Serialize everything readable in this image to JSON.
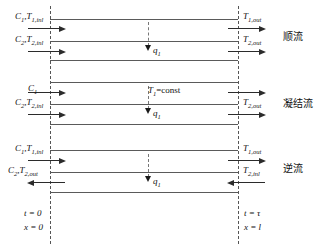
{
  "figure": {
    "type": "heat-exchanger-flow-diagram",
    "sections": [
      {
        "id": "parallel-flow",
        "mode_label": "顺流",
        "inlet_top": "C₁,T₁,inl",
        "inlet_bottom": "C₂,T₂,inl",
        "outlet_top": "T₁,out",
        "outlet_bottom": "T₂,out",
        "heat_flux": "q₁",
        "top_flow_direction": "right",
        "bottom_flow_direction": "right"
      },
      {
        "id": "condensing-flow",
        "mode_label": "凝结流",
        "inlet_top": "C₁",
        "inlet_bottom": "C₂,T₂,inl",
        "outlet_top": "",
        "outlet_bottom": "T₂,out",
        "center_note": "T₁=const",
        "heat_flux": "q₁",
        "top_flow_direction": "right",
        "bottom_flow_direction": "right"
      },
      {
        "id": "counter-flow",
        "mode_label": "逆流",
        "inlet_top": "C₁,T₁,inl",
        "inlet_bottom": "C₂,T₂,out",
        "outlet_top": "T₁,out",
        "outlet_bottom": "T₂,inl",
        "heat_flux": "q₁",
        "top_flow_direction": "right",
        "bottom_flow_direction": "left"
      }
    ],
    "axis": {
      "left_time": "t = 0",
      "left_position": "x = 0",
      "right_time": "t = τ",
      "right_position": "x = l"
    },
    "colors": {
      "wall": "#5a5a5a",
      "arrow": "#2b2b2b",
      "dashed": "#555555",
      "text": "#111111",
      "background": "#ffffff"
    }
  }
}
